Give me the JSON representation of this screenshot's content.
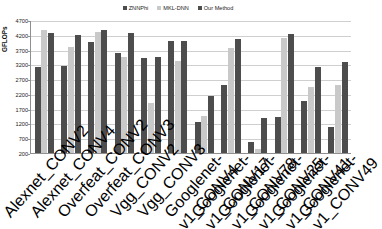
{
  "chart_data": {
    "type": "bar",
    "title": "",
    "xlabel": "",
    "ylabel": "GFLOPs",
    "ylim": [
      200,
      4700
    ],
    "yticks": [
      200,
      700,
      1200,
      1700,
      2200,
      2700,
      3200,
      3700,
      4200,
      4700
    ],
    "grid": true,
    "legend_position": "top-center",
    "categories": [
      "Alexnet_CONV2",
      "Alexnet_CONV4",
      "Overfeat_CONV2",
      "Overfeat_CONV3",
      "Vgg_CONV2",
      "Vgg_CONV3",
      "Googlenet-v1_CONV4",
      "Googlenet-v1_CONV17",
      "Googlenet-v1_CONV78",
      "Googlenet-v1_CONV25",
      "Googlenet-v1_CONV41",
      "Googlenet-v1_CONV49"
    ],
    "series": [
      {
        "name": "ZNNPhi",
        "color": "#4d4d4d",
        "values": [
          3100,
          3150,
          3950,
          3600,
          3420,
          3980,
          1250,
          2500,
          560,
          1430,
          1970,
          1080
        ]
      },
      {
        "name": "MKL-DNN",
        "color": "#c9c9c9",
        "values": [
          4370,
          3800,
          4300,
          3450,
          1900,
          3300,
          1450,
          3760,
          330,
          4080,
          2420,
          2490
        ]
      },
      {
        "name": "Our Method",
        "color": "#4d4d4d",
        "values": [
          4250,
          4190,
          4350,
          4250,
          3450,
          4000,
          2120,
          4050,
          1400,
          4220,
          3120,
          3270
        ]
      }
    ]
  },
  "legend": {
    "items": [
      {
        "label": "ZNNPhi"
      },
      {
        "label": "MKL-DNN"
      },
      {
        "label": "Our Method"
      }
    ]
  },
  "axis": {
    "ylabel": "GFLOPs"
  }
}
